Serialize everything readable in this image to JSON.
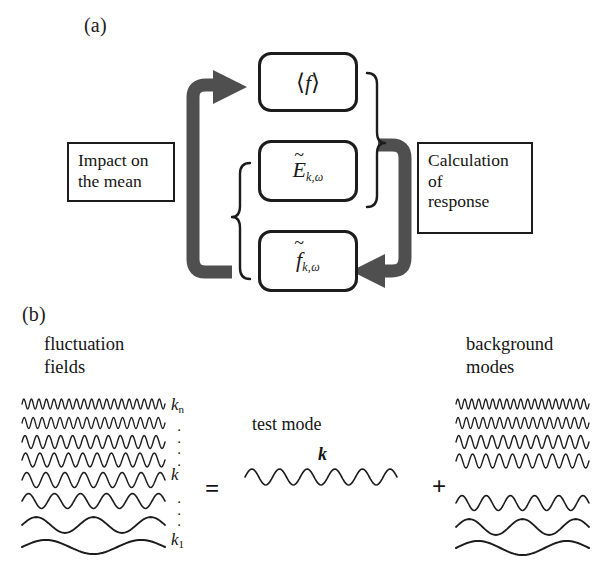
{
  "figure": {
    "panels": [
      {
        "id": "a",
        "label": "(a)"
      },
      {
        "id": "b",
        "label": "(b)"
      }
    ],
    "colors": {
      "stroke": "#1c1c1c",
      "arrow_gray": "#4f4f4f",
      "background": "#ffffff",
      "text": "#141414"
    }
  },
  "panel_a": {
    "label": "(a)",
    "state_boxes": [
      {
        "name": "mean-distribution",
        "math_main": "f",
        "math_left_delim": "⟨",
        "math_right_delim": "⟩",
        "has_tilde": false,
        "subscript": ""
      },
      {
        "name": "fluctuating-field",
        "math_main": "E",
        "math_left_delim": "",
        "math_right_delim": "",
        "has_tilde": true,
        "subscript": "k,ω"
      },
      {
        "name": "fluctuating-distribution",
        "math_main": "f",
        "math_left_delim": "",
        "math_right_delim": "",
        "has_tilde": true,
        "subscript": "k,ω"
      }
    ],
    "left_box": {
      "line1": "Impact on",
      "line2": "the mean"
    },
    "right_box": {
      "line1": "Calculation",
      "line2": "of",
      "line3": "response"
    },
    "arrows": [
      {
        "name": "impact-on-mean-arrow",
        "direction": "up-then-right",
        "points_to": "mean-distribution"
      },
      {
        "name": "calculation-of-response-arrow",
        "direction": "down-then-left",
        "points_to": "fluctuating-distribution"
      }
    ],
    "braces": [
      {
        "name": "response-brace",
        "side": "right",
        "groups": [
          "mean-distribution",
          "fluctuating-field"
        ]
      },
      {
        "name": "source-brace",
        "side": "left",
        "groups": [
          "fluctuating-field",
          "fluctuating-distribution"
        ]
      }
    ]
  },
  "panel_b": {
    "label": "(b)",
    "left_caption": {
      "line1": "fluctuation",
      "line2": "fields"
    },
    "right_caption": {
      "line1": "background",
      "line2": "modes"
    },
    "test_mode_caption": "test mode",
    "test_mode_k": "k",
    "operators": {
      "equals": "=",
      "plus": "+"
    },
    "k_axis": [
      {
        "type": "label",
        "text": "k",
        "subscript": "n"
      },
      {
        "type": "dots"
      },
      {
        "type": "label",
        "text": "k",
        "subscript": ""
      },
      {
        "type": "dots"
      },
      {
        "type": "label",
        "text": "k",
        "subscript": "1"
      }
    ]
  },
  "chart_data": {
    "type": "line",
    "xlabel": "",
    "ylabel": "",
    "series": [
      {
        "name": "fluctuation-fields-stack",
        "group": "left",
        "waves": [
          {
            "index": 8,
            "k_label": "k_n",
            "cycles": 19,
            "amplitude": 5.0,
            "stroke": 1.3
          },
          {
            "index": 7,
            "k_label": "",
            "cycles": 16,
            "amplitude": 5.5,
            "stroke": 1.3
          },
          {
            "index": 6,
            "k_label": "",
            "cycles": 12,
            "amplitude": 6.5,
            "stroke": 1.4
          },
          {
            "index": 5,
            "k_label": "",
            "cycles": 10,
            "amplitude": 7.0,
            "stroke": 1.4
          },
          {
            "index": 4,
            "k_label": "k",
            "cycles": 7.5,
            "amplitude": 7.5,
            "stroke": 1.5
          },
          {
            "index": 3,
            "k_label": "",
            "cycles": 5.5,
            "amplitude": 7.5,
            "stroke": 1.6
          },
          {
            "index": 2,
            "k_label": "",
            "cycles": 2.5,
            "amplitude": 8.0,
            "stroke": 1.8
          },
          {
            "index": 1,
            "k_label": "k_1",
            "cycles": 1.5,
            "amplitude": 7.0,
            "stroke": 2.0
          }
        ]
      },
      {
        "name": "test-mode",
        "group": "middle",
        "waves": [
          {
            "index": 4,
            "k_label": "k",
            "cycles": 5.5,
            "amplitude": 8.0,
            "stroke": 1.6
          }
        ]
      },
      {
        "name": "background-modes-stack",
        "group": "right",
        "waves": [
          {
            "index": 8,
            "k_label": "",
            "cycles": 19,
            "amplitude": 5.0,
            "stroke": 1.3
          },
          {
            "index": 7,
            "k_label": "",
            "cycles": 16,
            "amplitude": 5.5,
            "stroke": 1.3
          },
          {
            "index": 6,
            "k_label": "",
            "cycles": 12,
            "amplitude": 6.5,
            "stroke": 1.4
          },
          {
            "index": 5,
            "k_label": "",
            "cycles": 10,
            "amplitude": 7.0,
            "stroke": 1.4
          },
          {
            "index": 3,
            "k_label": "",
            "cycles": 5.5,
            "amplitude": 7.5,
            "stroke": 1.6
          },
          {
            "index": 2,
            "k_label": "",
            "cycles": 2.5,
            "amplitude": 8.0,
            "stroke": 1.8
          },
          {
            "index": 1,
            "k_label": "",
            "cycles": 1.5,
            "amplitude": 7.0,
            "stroke": 2.0
          }
        ]
      }
    ]
  }
}
